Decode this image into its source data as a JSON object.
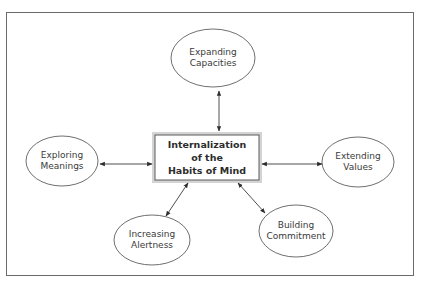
{
  "diagram": {
    "center": {
      "lines": [
        "Internalization",
        "of the",
        "Habits of Mind"
      ]
    },
    "nodes": [
      {
        "id": "expanding-capacities",
        "lines": [
          "Expanding",
          "Capacities"
        ]
      },
      {
        "id": "exploring-meanings",
        "lines": [
          "Exploring",
          "Meanings"
        ]
      },
      {
        "id": "extending-values",
        "lines": [
          "Extending",
          "Values"
        ]
      },
      {
        "id": "increasing-alertness",
        "lines": [
          "Increasing",
          "Alertness"
        ]
      },
      {
        "id": "building-commitment",
        "lines": [
          "Building",
          "Commitment"
        ]
      }
    ],
    "connections": [
      {
        "from": "center",
        "to": "expanding-capacities",
        "type": "bidirectional-arrow"
      },
      {
        "from": "center",
        "to": "exploring-meanings",
        "type": "bidirectional-arrow"
      },
      {
        "from": "center",
        "to": "extending-values",
        "type": "bidirectional-arrow"
      },
      {
        "from": "center",
        "to": "increasing-alertness",
        "type": "bidirectional-arrow"
      },
      {
        "from": "center",
        "to": "building-commitment",
        "type": "bidirectional-arrow"
      }
    ],
    "colors": {
      "line": "#3a3a3a",
      "box_halo": "#cfcfcf",
      "frame": "#6a6a6a",
      "background": "#ffffff"
    }
  }
}
